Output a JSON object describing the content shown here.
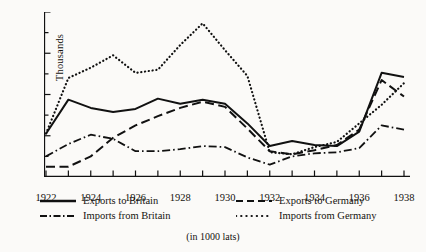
{
  "caption": "(in 1000 lats)",
  "axes": {
    "y_title": "Thousands",
    "y_ticks": [
      "0",
      "40",
      "80",
      "120",
      "160"
    ],
    "x_ticks": [
      "1922",
      "1924",
      "1926",
      "1928",
      "1930",
      "1932",
      "1934",
      "1936",
      "1938"
    ]
  },
  "legend": {
    "items": [
      {
        "label": "Exports to Britain",
        "style": "solid",
        "swatch": "exports-britain-swatch"
      },
      {
        "label": "Exports to Germany",
        "style": "dashed",
        "swatch": "exports-germany-swatch"
      },
      {
        "label": "Imports from Britain",
        "style": "dash-dot",
        "swatch": "imports-britain-swatch"
      },
      {
        "label": "Imports from Germany",
        "style": "dotted",
        "swatch": "imports-germany-swatch"
      }
    ]
  },
  "chart_data": {
    "type": "line",
    "title": "",
    "subtitle": "",
    "xlabel": "",
    "ylabel": "Thousands",
    "annotation": "(in 1000 lats)",
    "units": "1000 lats",
    "grid": false,
    "legend_position": "below-plot",
    "xlim": [
      1922,
      1938
    ],
    "ylim": [
      0,
      160
    ],
    "y_ticks_major": [
      0,
      40,
      80,
      120,
      160
    ],
    "y_ticks_minor_step": 20,
    "x": [
      1922,
      1923,
      1924,
      1925,
      1926,
      1927,
      1928,
      1929,
      1930,
      1931,
      1932,
      1933,
      1934,
      1935,
      1936,
      1937,
      1938
    ],
    "series": [
      {
        "name": "Exports to Britain",
        "style": "solid",
        "color": "#111111",
        "values": [
          42,
          75,
          67,
          63,
          66,
          76,
          71,
          75,
          71,
          52,
          30,
          35,
          31,
          30,
          44,
          101,
          97
        ]
      },
      {
        "name": "Exports to Germany",
        "style": "dashed",
        "color": "#111111",
        "values": [
          10,
          10,
          20,
          38,
          50,
          59,
          67,
          73,
          68,
          47,
          25,
          22,
          26,
          31,
          46,
          94,
          78
        ]
      },
      {
        "name": "Imports from Britain",
        "style": "dash-dot",
        "color": "#111111",
        "values": [
          20,
          32,
          41,
          37,
          25,
          25,
          27,
          30,
          29,
          19,
          12,
          20,
          23,
          24,
          28,
          50,
          46
        ]
      },
      {
        "name": "Imports from Germany",
        "style": "dotted",
        "color": "#111111",
        "values": [
          42,
          96,
          106,
          118,
          101,
          104,
          128,
          149,
          123,
          98,
          24,
          22,
          29,
          34,
          52,
          70,
          91
        ]
      }
    ]
  }
}
